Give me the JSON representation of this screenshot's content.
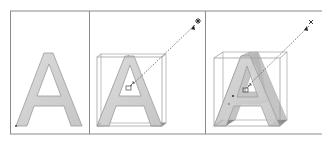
{
  "figure": {
    "colors": {
      "frame": "#8a8a8a",
      "letter_fill": "#d2d2d2",
      "letter_stroke": "#9a9a9a",
      "side_fill": "#b9b9b9",
      "dark_side": "#8c8c8c",
      "bbox": "#a8a8a8",
      "vanish_line": "#555555",
      "marker": "#222222"
    },
    "panels": [
      {
        "id": "flat",
        "label": "",
        "glyph": "A",
        "extruded": false
      },
      {
        "id": "extrude-shallow",
        "label": "",
        "glyph": "A",
        "extruded": true,
        "vanishing_point_icon": "star-handle-icon",
        "center_icon": "extrude-handle-icon"
      },
      {
        "id": "extrude-deep",
        "label": "",
        "glyph": "A",
        "extruded": true,
        "vanishing_point_icon": "x-handle-icon",
        "center_icon": "extrude-handle-icon"
      }
    ]
  }
}
